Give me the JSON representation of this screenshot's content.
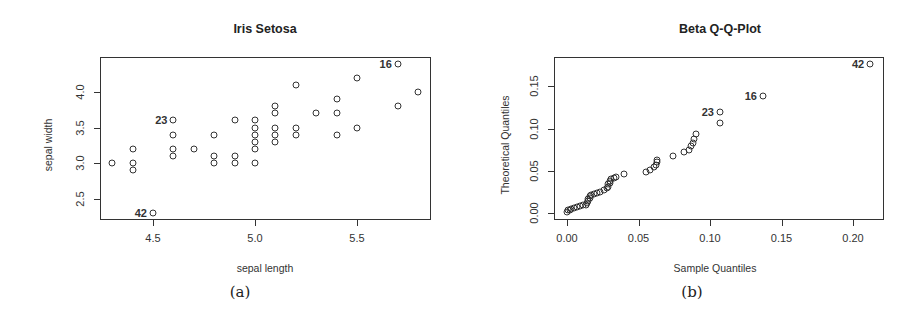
{
  "chart_data": [
    {
      "type": "scatter",
      "title": "Iris Setosa",
      "xlabel": "sepal length",
      "ylabel": "sepal width",
      "caption": "(a)",
      "xlim": [
        4.25,
        5.85
      ],
      "ylim": [
        2.2,
        4.45
      ],
      "xticks": [
        "4.5",
        "5.0",
        "5.5"
      ],
      "yticks": [
        "2.5",
        "3.0",
        "3.5",
        "4.0"
      ],
      "grid": false,
      "points": [
        [
          4.3,
          3.0
        ],
        [
          4.4,
          3.2
        ],
        [
          4.4,
          3.0
        ],
        [
          4.4,
          2.9
        ],
        [
          4.5,
          2.3
        ],
        [
          4.6,
          3.6
        ],
        [
          4.6,
          3.4
        ],
        [
          4.6,
          3.2
        ],
        [
          4.6,
          3.1
        ],
        [
          4.7,
          3.2
        ],
        [
          4.8,
          3.4
        ],
        [
          4.8,
          3.1
        ],
        [
          4.8,
          3.0
        ],
        [
          4.9,
          3.6
        ],
        [
          4.9,
          3.1
        ],
        [
          4.9,
          3.0
        ],
        [
          5.0,
          3.6
        ],
        [
          5.0,
          3.5
        ],
        [
          5.0,
          3.4
        ],
        [
          5.0,
          3.3
        ],
        [
          5.0,
          3.2
        ],
        [
          5.0,
          3.0
        ],
        [
          5.1,
          3.8
        ],
        [
          5.1,
          3.7
        ],
        [
          5.1,
          3.5
        ],
        [
          5.1,
          3.4
        ],
        [
          5.1,
          3.3
        ],
        [
          5.2,
          4.1
        ],
        [
          5.2,
          3.5
        ],
        [
          5.2,
          3.4
        ],
        [
          5.3,
          3.7
        ],
        [
          5.4,
          3.9
        ],
        [
          5.4,
          3.7
        ],
        [
          5.4,
          3.4
        ],
        [
          5.5,
          4.2
        ],
        [
          5.5,
          3.5
        ],
        [
          5.7,
          4.4
        ],
        [
          5.7,
          3.8
        ],
        [
          5.8,
          4.0
        ]
      ],
      "annotations": [
        {
          "label": "16",
          "x": 5.7,
          "y": 4.4
        },
        {
          "label": "23",
          "x": 4.6,
          "y": 3.6
        },
        {
          "label": "42",
          "x": 4.5,
          "y": 2.3
        }
      ]
    },
    {
      "type": "scatter",
      "title": "Beta Q-Q-Plot",
      "xlabel": "Sample Quantiles",
      "ylabel": "Theoretical Quantiles",
      "caption": "(b)",
      "xlim": [
        -0.008,
        0.222
      ],
      "ylim": [
        -0.007,
        0.18
      ],
      "xticks": [
        "0.00",
        "0.05",
        "0.10",
        "0.15",
        "0.20"
      ],
      "yticks": [
        "0.00",
        "0.05",
        "0.10",
        "0.15"
      ],
      "grid": false,
      "points": [
        [
          0.0,
          0.001
        ],
        [
          0.001,
          0.003
        ],
        [
          0.002,
          0.004
        ],
        [
          0.003,
          0.005
        ],
        [
          0.005,
          0.006
        ],
        [
          0.007,
          0.007
        ],
        [
          0.009,
          0.008
        ],
        [
          0.011,
          0.009
        ],
        [
          0.013,
          0.01
        ],
        [
          0.014,
          0.012
        ],
        [
          0.015,
          0.014
        ],
        [
          0.015,
          0.016
        ],
        [
          0.016,
          0.018
        ],
        [
          0.016,
          0.02
        ],
        [
          0.017,
          0.021
        ],
        [
          0.019,
          0.022
        ],
        [
          0.021,
          0.024
        ],
        [
          0.023,
          0.025
        ],
        [
          0.026,
          0.027
        ],
        [
          0.028,
          0.029
        ],
        [
          0.029,
          0.031
        ],
        [
          0.029,
          0.034
        ],
        [
          0.03,
          0.036
        ],
        [
          0.03,
          0.038
        ],
        [
          0.031,
          0.04
        ],
        [
          0.033,
          0.042
        ],
        [
          0.034,
          0.043
        ],
        [
          0.04,
          0.046
        ],
        [
          0.055,
          0.048
        ],
        [
          0.058,
          0.051
        ],
        [
          0.061,
          0.054
        ],
        [
          0.062,
          0.057
        ],
        [
          0.063,
          0.06
        ],
        [
          0.063,
          0.063
        ],
        [
          0.074,
          0.068
        ],
        [
          0.082,
          0.072
        ],
        [
          0.085,
          0.075
        ],
        [
          0.087,
          0.079
        ],
        [
          0.088,
          0.083
        ],
        [
          0.089,
          0.088
        ],
        [
          0.09,
          0.093
        ],
        [
          0.107,
          0.107
        ],
        [
          0.107,
          0.12
        ],
        [
          0.137,
          0.138
        ],
        [
          0.212,
          0.176
        ]
      ],
      "annotations": [
        {
          "label": "42",
          "x": 0.212,
          "y": 0.176
        },
        {
          "label": "16",
          "x": 0.137,
          "y": 0.138
        },
        {
          "label": "23",
          "x": 0.107,
          "y": 0.12
        }
      ]
    }
  ],
  "left": {
    "title": "Iris Setosa",
    "xlabel": "sepal length",
    "ylabel": "sepal width",
    "caption": "(a)",
    "xticks": [
      "4.5",
      "5.0",
      "5.5"
    ],
    "yticks": [
      "2.5",
      "3.0",
      "3.5",
      "4.0"
    ]
  },
  "right": {
    "title": "Beta Q-Q-Plot",
    "xlabel": "Sample Quantiles",
    "ylabel": "Theoretical Quantiles",
    "caption": "(b)",
    "xticks": [
      "0.00",
      "0.05",
      "0.10",
      "0.15",
      "0.20"
    ],
    "yticks": [
      "0.00",
      "0.05",
      "0.10",
      "0.15"
    ]
  },
  "style": {
    "ink": "#333333",
    "background": "#ffffff"
  }
}
